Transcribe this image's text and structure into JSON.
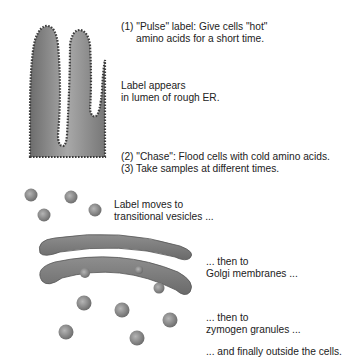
{
  "diagram": {
    "labels": {
      "pulse": [
        "(1) \"Pulse\" label: Give cells \"hot\"",
        "amino acids for a short time."
      ],
      "rough_er": [
        "Label appears",
        "in lumen of rough ER."
      ],
      "chase": [
        "(2) \"Chase\": Flood cells with cold amino acids.",
        "(3) Take samples at different times."
      ],
      "transitional": [
        "Label moves to",
        "transitional vesicles ..."
      ],
      "golgi": [
        "... then to",
        "Golgi membranes ..."
      ],
      "zymogen": [
        "... then to",
        "zymogen granules ..."
      ],
      "outside": [
        "... and finally outside the cells."
      ]
    },
    "colors": {
      "organelle_fill": "#8a8a8a",
      "organelle_dark": "#5a5a5a",
      "vesicle_fill": "#9a9a9a",
      "text": "#222222"
    }
  }
}
